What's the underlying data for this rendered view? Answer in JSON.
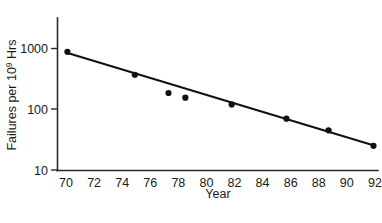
{
  "chart_data": {
    "type": "scatter",
    "title": "",
    "xlabel": "Year",
    "ylabel": "Failures per 10⁹ Hrs",
    "ylabel_parts": {
      "pre": "Failures per 10",
      "sup": "9",
      "post": " Hrs"
    },
    "xlim": [
      69.2,
      92.6
    ],
    "ylim": [
      10,
      1800
    ],
    "yscale": "log",
    "xscale": "linear",
    "grid": false,
    "legend": null,
    "x_ticks": [
      70,
      72,
      74,
      76,
      78,
      80,
      82,
      84,
      86,
      88,
      90,
      92
    ],
    "x_tick_labels": [
      "70",
      "72",
      "74",
      "76",
      "78",
      "80",
      "82",
      "84",
      "86",
      "88",
      "90",
      "92"
    ],
    "y_ticks": [
      10,
      100,
      1000
    ],
    "y_tick_labels": [
      "10",
      "100",
      "1000"
    ],
    "series": [
      {
        "name": "Observed failure rate",
        "marker": "filled-circle",
        "x": [
          70.1,
          74.9,
          77.3,
          78.5,
          81.8,
          85.7,
          88.7,
          91.9
        ],
        "y": [
          880,
          370,
          185,
          155,
          120,
          70,
          45,
          25
        ]
      }
    ],
    "fit_line": {
      "name": "Log-linear trend line",
      "x": [
        70.0,
        92.0
      ],
      "y": [
        860,
        25
      ]
    }
  },
  "annotations": {
    "x_axis_name": "Year",
    "y_axis_name": "Failures per 10⁹ Hrs"
  }
}
